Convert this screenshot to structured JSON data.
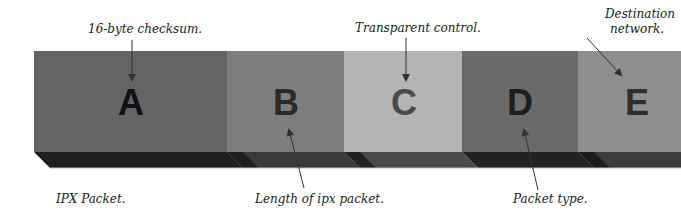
{
  "diagram": {
    "title": "IPX Packet.",
    "segments": [
      {
        "letter": "A",
        "face": "#646464",
        "letter_color": "#111111"
      },
      {
        "letter": "B",
        "face": "#7e7e7e",
        "letter_color": "#2a2a2a"
      },
      {
        "letter": "C",
        "face": "#b4b4b4",
        "letter_color": "#4a4a4a"
      },
      {
        "letter": "D",
        "face": "#6a6a6a",
        "letter_color": "#1e1e1e"
      },
      {
        "letter": "E",
        "face": "#8e8e8e",
        "letter_color": "#2e2e2e"
      }
    ],
    "annotations": {
      "a": "16-byte checksum.",
      "b": "Length of ipx packet.",
      "c": "Transparent control.",
      "d": "Packet type.",
      "e_line1": "Destination",
      "e_line2": "network."
    },
    "colors": {
      "base_dark": "#1c1c1c",
      "base_mid": "#3a3a3a",
      "arrow": "#333333"
    }
  }
}
